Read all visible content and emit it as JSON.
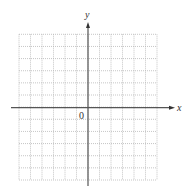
{
  "diagram": {
    "type": "coordinate-grid",
    "x_axis_label": "x",
    "y_axis_label": "y",
    "origin_label": "0",
    "grid": {
      "columns": 12,
      "rows": 12,
      "left": 19,
      "top": 34.3,
      "right": 157,
      "bottom": 180,
      "line_color": "#b8b8b8",
      "line_style": "dotted"
    },
    "axes": {
      "color": "#555555",
      "origin_px": [
        88,
        107.7
      ],
      "x_axis_extent": [
        11,
        175
      ],
      "y_axis_extent": [
        22,
        186
      ]
    }
  }
}
